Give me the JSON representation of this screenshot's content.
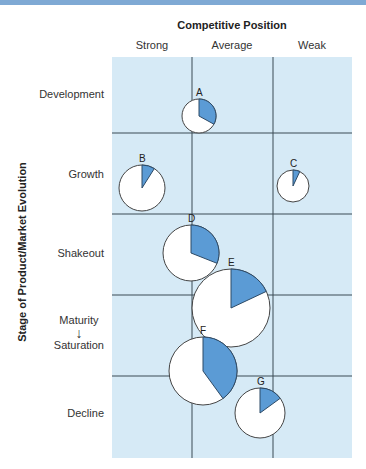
{
  "chart_data": {
    "type": "bubble-pie-matrix",
    "title": "",
    "xlabel": "Competitive Position",
    "ylabel": "Stage of Product/Market Evolution",
    "x_categories": [
      "Strong",
      "Average",
      "Weak"
    ],
    "y_categories": [
      "Development",
      "Growth",
      "Shakeout",
      "Maturity ↓ Saturation",
      "Decline"
    ],
    "grid": true,
    "colors": {
      "background": "#d6eaf6",
      "wedge": "#5b9bd5",
      "grid_line": "#3a4a55",
      "pie_fill": "#ffffff"
    },
    "points": [
      {
        "label": "A",
        "cx": 199,
        "cy": 116,
        "r": 17,
        "share_pct": 33
      },
      {
        "label": "B",
        "cx": 142,
        "cy": 188,
        "r": 23,
        "share_pct": 9
      },
      {
        "label": "C",
        "cx": 293,
        "cy": 186,
        "r": 16,
        "share_pct": 7
      },
      {
        "label": "D",
        "cx": 191,
        "cy": 253,
        "r": 28,
        "share_pct": 31
      },
      {
        "label": "E",
        "cx": 231,
        "cy": 308,
        "r": 39,
        "share_pct": 18
      },
      {
        "label": "F",
        "cx": 203,
        "cy": 371,
        "r": 34,
        "share_pct": 40
      },
      {
        "label": "G",
        "cx": 260,
        "cy": 413,
        "r": 25,
        "share_pct": 15
      }
    ]
  },
  "labels": {
    "x_title": "Competitive Position",
    "x_strong": "Strong",
    "x_average": "Average",
    "x_weak": "Weak",
    "y_title": "Stage of Product/Market Evolution",
    "y_development": "Development",
    "y_growth": "Growth",
    "y_shakeout": "Shakeout",
    "y_maturity": "Maturity",
    "y_arrow": "↓",
    "y_saturation": "Saturation",
    "y_decline": "Decline"
  }
}
